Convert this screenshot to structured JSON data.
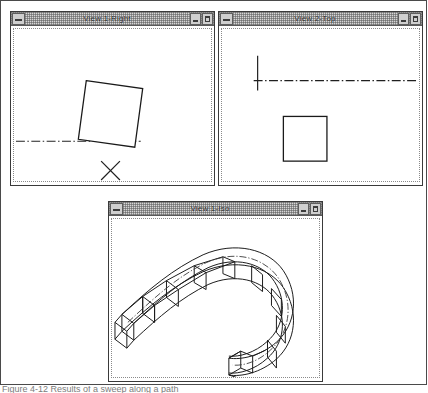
{
  "application": {
    "style": "windows-3x-mdi-cad",
    "background_color": "#ffffff",
    "frame_border_color": "#4a4a4a",
    "titlebar_color": "#d6d6d6",
    "line_color": "#1a1a1a"
  },
  "windows": [
    {
      "id": "view-1-right",
      "title": "View 1-Right",
      "sysmenu_icon": "control-menu-icon",
      "minimize_icon": "minimize-icon",
      "maximize_icon": "maximize-icon",
      "content": "Front/right orthographic view: a slightly rotated square profile, a horizontal dash-dot centerline, and an X axis-marker below"
    },
    {
      "id": "view-2-top",
      "title": "View 2-Top",
      "sysmenu_icon": "control-menu-icon",
      "minimize_icon": "minimize-icon",
      "maximize_icon": "maximize-icon",
      "content": "Top orthographic view: a short vertical line, a long horizontal dash-dot centerline, and a square profile below"
    },
    {
      "id": "view-1-iso",
      "title": "View 1-Iso",
      "sysmenu_icon": "control-menu-icon",
      "minimize_icon": "minimize-icon",
      "maximize_icon": "maximize-icon",
      "content": "Isometric view: a U-shaped swept solid built from rectangular box segments following a curved path with a dash-dot spine"
    }
  ],
  "caption": {
    "text": "Figure 4-12  Results of a sweep along a path"
  }
}
